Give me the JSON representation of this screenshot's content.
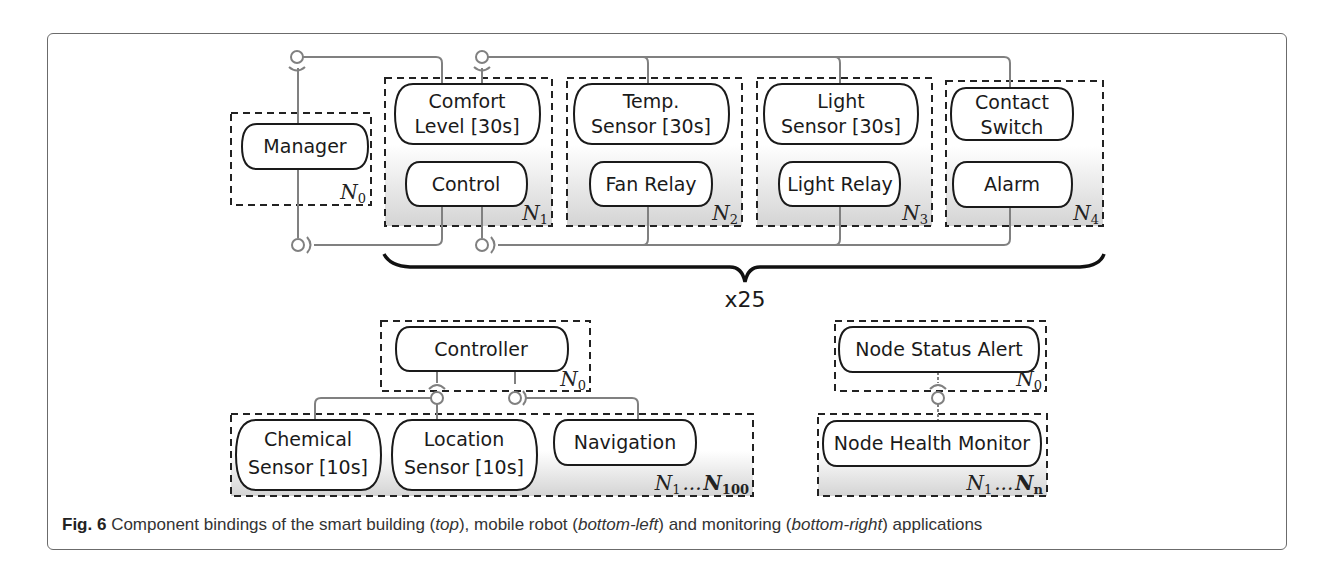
{
  "figure": {
    "caption": {
      "label": "Fig. 6",
      "text_1": " Component bindings of the smart building (",
      "em_1": "top",
      "text_2": "), mobile robot (",
      "em_2": "bottom-left",
      "text_3": ") and monitoring (",
      "em_3": "bottom-right",
      "text_4": ") applications"
    },
    "smart_building": {
      "multiplier": "x25",
      "nodes": [
        {
          "id": "N0",
          "label": "N",
          "sub": "0",
          "components": [
            {
              "lines": [
                "Manager"
              ]
            }
          ]
        },
        {
          "id": "N1",
          "label": "N",
          "sub": "1",
          "components": [
            {
              "lines": [
                "Comfort",
                "Level [30s]"
              ]
            },
            {
              "lines": [
                "Control"
              ]
            }
          ]
        },
        {
          "id": "N2",
          "label": "N",
          "sub": "2",
          "components": [
            {
              "lines": [
                "Temp.",
                "Sensor [30s]"
              ]
            },
            {
              "lines": [
                "Fan Relay"
              ]
            }
          ]
        },
        {
          "id": "N3",
          "label": "N",
          "sub": "3",
          "components": [
            {
              "lines": [
                "Light",
                "Sensor [30s]"
              ]
            },
            {
              "lines": [
                "Light Relay"
              ]
            }
          ]
        },
        {
          "id": "N4",
          "label": "N",
          "sub": "4",
          "components": [
            {
              "lines": [
                "Contact",
                "Switch"
              ]
            },
            {
              "lines": [
                "Alarm"
              ]
            }
          ]
        }
      ]
    },
    "mobile_robot": {
      "nodes": [
        {
          "id": "N0",
          "label": "N",
          "sub": "0",
          "components": [
            {
              "lines": [
                "Controller"
              ]
            }
          ]
        },
        {
          "id": "N1..N100",
          "label_start": "N",
          "sub_start": "1",
          "ellipsis": "...",
          "label_end": "N",
          "sub_end": "100",
          "components": [
            {
              "lines": [
                "Chemical",
                "Sensor [10s]"
              ]
            },
            {
              "lines": [
                "Location",
                "Sensor [10s]"
              ]
            },
            {
              "lines": [
                "Navigation"
              ]
            }
          ]
        }
      ]
    },
    "monitoring": {
      "nodes": [
        {
          "id": "N0",
          "label": "N",
          "sub": "0",
          "components": [
            {
              "lines": [
                "Node Status Alert"
              ]
            }
          ]
        },
        {
          "id": "N1..Nn",
          "label_start": "N",
          "sub_start": "1",
          "ellipsis": "...",
          "label_end": "N",
          "sub_end": "n",
          "components": [
            {
              "lines": [
                "Node Health Monitor"
              ]
            }
          ]
        }
      ]
    },
    "colors": {
      "frame": "#6b6b6b",
      "component_stroke": "#1a1a1a",
      "wire": "#808080",
      "node_gradient_bottom": "#d4d4d4"
    }
  }
}
